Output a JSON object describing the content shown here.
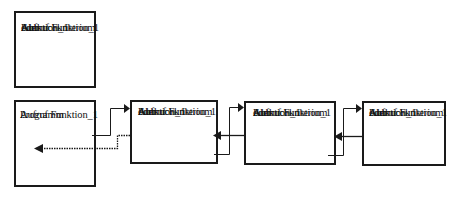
{
  "diagram": {
    "type": "recursion-call-chain",
    "definition_box": {
      "lines": [
        "Funktion_1",
        "...",
        "Abbruchkriterium",
        "oder",
        "Aufruf Funktion_1"
      ]
    },
    "program_box": {
      "lines": [
        "Programm",
        "...",
        "Aufruf Funktion_1",
        "..."
      ]
    },
    "call_boxes": [
      {
        "lines": [
          "Funktion_1",
          "...",
          "Abbruchkriterium",
          "oder",
          "Aufruf Funktion_1"
        ]
      },
      {
        "lines": [
          "Funktion_1",
          "...",
          "Abbruchkriterium",
          "oder",
          "Aufruf Funktion_1"
        ]
      },
      {
        "lines": [
          "Funktion_1",
          "...",
          "Abbruchkriterium",
          "oder",
          "Aufruf Funktion_1"
        ]
      }
    ],
    "connections": [
      {
        "from": "program_box",
        "to": "call_boxes.0",
        "kind": "call"
      },
      {
        "from": "call_boxes.0",
        "to": "program_box",
        "kind": "return"
      },
      {
        "from": "call_boxes.0",
        "to": "call_boxes.1",
        "kind": "call"
      },
      {
        "from": "call_boxes.1",
        "to": "call_boxes.0",
        "kind": "return"
      },
      {
        "from": "call_boxes.1",
        "to": "call_boxes.2",
        "kind": "call"
      },
      {
        "from": "call_boxes.2",
        "to": "call_boxes.1",
        "kind": "return"
      }
    ],
    "colors": {
      "stroke": "#1a1a1a",
      "background": "#ffffff"
    }
  }
}
